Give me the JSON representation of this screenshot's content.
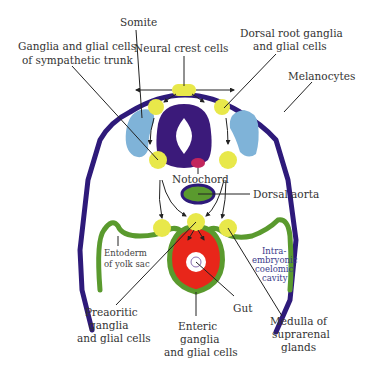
{
  "diagram": {
    "colors": {
      "ectoderm": "#2e1a7a",
      "neural_tube": "#3b1a7a",
      "neural_crest": "#e8e84a",
      "somite": "#7fb3d8",
      "notochord": "#c2255c",
      "endoderm": "#5a9a2e",
      "gut_wall": "#e8261a",
      "aorta_fill": "#5a9a2e",
      "leader_line": "#222222"
    },
    "labels": {
      "somite": "Somite",
      "neural_crest": "Neural crest cells",
      "sympathetic_line1": "Ganglia and glial cells",
      "sympathetic_line2": "of sympathetic trunk",
      "dorsal_root_line1": "Dorsal root ganglia",
      "dorsal_root_line2": "and glial cells",
      "melanocytes": "Melanocytes",
      "notochord": "Notochord",
      "dorsal_aorta": "Dorsal aorta",
      "entoderm_line1": "Entoderm",
      "entoderm_line2": "of yolk sac",
      "coelom_line1": "Intra-",
      "coelom_line2": "embryonic",
      "coelom_line3": "coelomic",
      "coelom_line4": "cavity",
      "preaortic_line1": "Preaoritic",
      "preaortic_line2": "ganglia",
      "preaortic_line3": "and glial cells",
      "gut": "Gut",
      "enteric_line1": "Enteric",
      "enteric_line2": "ganglia",
      "enteric_line3": "and glial cells",
      "medulla_line1": "Medulla of",
      "medulla_line2": "suprarenal",
      "medulla_line3": "glands"
    }
  }
}
